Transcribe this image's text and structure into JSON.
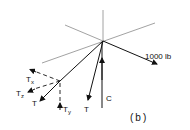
{
  "figure": {
    "label": "(b)",
    "type": "free-body diagram"
  },
  "labels": {
    "force_applied": "1000 lb",
    "tension_main": "T",
    "tension_left": "T",
    "tension_x": "T",
    "tension_x_sub": "x",
    "tension_z": "T",
    "tension_z_sub": "z",
    "tension_y": "T",
    "tension_y_sub": "y",
    "compression": "C"
  },
  "colors": {
    "axis": "#8a8a8a",
    "force": "#111111"
  }
}
